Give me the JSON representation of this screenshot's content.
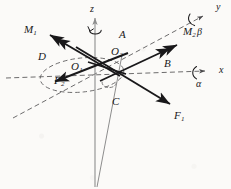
{
  "figure": {
    "canvas": {
      "width": 231,
      "height": 189
    },
    "colors": {
      "stroke_dark": "#19181a",
      "stroke_axis": "#8d8d8d",
      "stroke_dashed": "#5c5b5c",
      "background": "#fbfaf8"
    }
  },
  "axes": [
    {
      "id": "x-axis",
      "label": "x",
      "style": "dashed",
      "direction": "right",
      "label_pos": {
        "x": 219,
        "y": 72
      },
      "line": {
        "x1": 6,
        "y1": 78,
        "x2": 214,
        "y2": 71
      }
    },
    {
      "id": "y-axis",
      "label": "y",
      "style": "dashed",
      "direction": "up-right",
      "label_pos": {
        "x": 213,
        "y": 7
      },
      "line": {
        "x1": 13,
        "y1": 118,
        "x2": 206,
        "y2": 14
      }
    },
    {
      "id": "z-axis",
      "label": "z",
      "style": "solid-gray",
      "direction": "up",
      "label_pos": {
        "x": 90,
        "y": 9
      },
      "line": {
        "x1": 95,
        "y1": 186,
        "x2": 95,
        "y2": 17
      }
    }
  ],
  "angles": [
    {
      "id": "alpha",
      "label": "α",
      "about_axis": "x",
      "pos": {
        "x": 200,
        "y": 80
      }
    },
    {
      "id": "beta",
      "label": "β",
      "about_axis": "y",
      "pos": {
        "x": 200,
        "y": 26
      }
    }
  ],
  "moment_vectors": [
    {
      "id": "M1",
      "label": "M",
      "subscript": "1",
      "arrowhead": "double",
      "label_pos": {
        "x": 28,
        "y": 28
      },
      "line": {
        "x1": 120,
        "y1": 76,
        "x2": 45,
        "y2": 32
      }
    },
    {
      "id": "M2",
      "label": "M",
      "subscript": "2",
      "arrowhead": "double",
      "label_pos": {
        "x": 185,
        "y": 31
      },
      "line": {
        "x1": 100,
        "y1": 80,
        "x2": 180,
        "y2": 43
      }
    }
  ],
  "force_vectors": [
    {
      "id": "F1",
      "label": "F",
      "subscript": "1",
      "arrowhead": "single",
      "label_pos": {
        "x": 176,
        "y": 115
      },
      "line": {
        "x1": 76,
        "y1": 47,
        "x2": 173,
        "y2": 106
      }
    },
    {
      "id": "F2",
      "label": "F",
      "subscript": "2",
      "arrowhead": "single",
      "label_pos": {
        "x": 56,
        "y": 79
      },
      "line": {
        "x1": 128,
        "y1": 53,
        "x2": 51,
        "y2": 83
      }
    }
  ],
  "points": [
    {
      "id": "O1",
      "label": "O",
      "subscript": "1",
      "label_pos": {
        "x": 73,
        "y": 66
      }
    },
    {
      "id": "O2",
      "label": "O",
      "subscript": "2",
      "label_pos": {
        "x": 113,
        "y": 51
      }
    }
  ],
  "annotations": [
    {
      "id": "label-A",
      "label": "A",
      "pos": {
        "x": 122,
        "y": 33
      }
    },
    {
      "id": "label-B",
      "label": "B",
      "pos": {
        "x": 166,
        "y": 62
      }
    },
    {
      "id": "label-C",
      "label": "C",
      "pos": {
        "x": 114,
        "y": 101
      }
    },
    {
      "id": "label-D",
      "label": "D",
      "pos": {
        "x": 40,
        "y": 55
      }
    }
  ],
  "shapes": [
    {
      "id": "orbit-ellipse",
      "kind": "ellipse",
      "style": "dashed",
      "cx": 82,
      "cy": 75,
      "rx": 42,
      "ry": 17,
      "rotation": -6
    },
    {
      "id": "member-C-line",
      "kind": "line",
      "style": "thin-gray",
      "x1": 122,
      "y1": 55,
      "x2": 97,
      "y2": 187
    }
  ]
}
